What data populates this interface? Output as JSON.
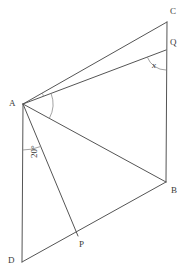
{
  "figure": {
    "type": "geometry-diagram",
    "width": 185,
    "height": 273,
    "background_color": "#ffffff",
    "stroke_color": "#555555",
    "label_color": "#3a3a3a"
  },
  "points": {
    "A": {
      "label": "A",
      "x": 23,
      "y": 104,
      "label_x": 9,
      "label_y": 101
    },
    "B": {
      "label": "B",
      "x": 166,
      "y": 182,
      "label_x": 171,
      "label_y": 188
    },
    "C": {
      "label": "C",
      "x": 167,
      "y": 22,
      "label_x": 171,
      "label_y": 8
    },
    "D": {
      "label": "D",
      "x": 22,
      "y": 262,
      "label_x": 8,
      "label_y": 257
    },
    "P": {
      "label": "P",
      "x": 78,
      "y": 236,
      "label_x": 80,
      "label_y": 241
    },
    "Q": {
      "label": "Q",
      "x": 166,
      "y": 50,
      "label_x": 171,
      "label_y": 38
    }
  },
  "segments": [
    {
      "name": "segment-A-C",
      "from": "A",
      "to": "C"
    },
    {
      "name": "segment-A-Q",
      "from": "A",
      "to": "Q"
    },
    {
      "name": "segment-A-B",
      "from": "A",
      "to": "B"
    },
    {
      "name": "segment-A-D",
      "from": "A",
      "to": "D"
    },
    {
      "name": "segment-A-P",
      "from": "A",
      "to": "P"
    },
    {
      "name": "segment-C-B",
      "from": "C",
      "to": "B"
    },
    {
      "name": "segment-D-B",
      "from": "D",
      "to": "B"
    }
  ],
  "angles": [
    {
      "name": "angle-at-A-20deg",
      "label": "20°",
      "vertex": "A",
      "label_x": 25,
      "label_y": 158,
      "rotated": true
    },
    {
      "name": "angle-at-Q-x",
      "label": "x",
      "vertex": "Q",
      "label_x": 152,
      "label_y": 62,
      "rotated": false
    }
  ],
  "chart_data": {
    "type": "diagram",
    "title": "",
    "labels": [
      "A",
      "B",
      "C",
      "D",
      "P",
      "Q",
      "20°",
      "x"
    ]
  }
}
